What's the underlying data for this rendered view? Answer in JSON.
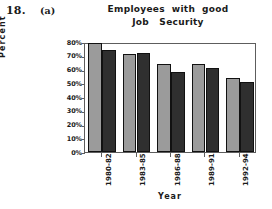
{
  "header": {
    "question_number": "18.",
    "part_label": "(a)",
    "title_line1": "Employees  with  good",
    "title_line2": "Job   Security"
  },
  "chart_data": {
    "type": "bar",
    "title": "Employees with good Job Security",
    "xlabel": "Year",
    "ylabel": "Percent",
    "categories": [
      "1980-82",
      "1983-85",
      "1986-88",
      "1989-91",
      "1992-94"
    ],
    "series": [
      {
        "name": "series-1",
        "color": "#9b9b9b",
        "values": [
          79,
          71,
          64,
          64,
          54
        ]
      },
      {
        "name": "series-2",
        "color": "#2f2f2f",
        "values": [
          74,
          72,
          58,
          61,
          51
        ]
      }
    ],
    "ylim": [
      0,
      80
    ],
    "ytick_values": [
      80,
      70,
      60,
      50,
      40,
      30,
      20,
      10,
      0
    ],
    "ytick_labels": [
      "80%",
      "70%",
      "60%",
      "50%",
      "40%",
      "30%",
      "20%",
      "10%",
      "0%"
    ],
    "grid": false,
    "legend": "none"
  }
}
